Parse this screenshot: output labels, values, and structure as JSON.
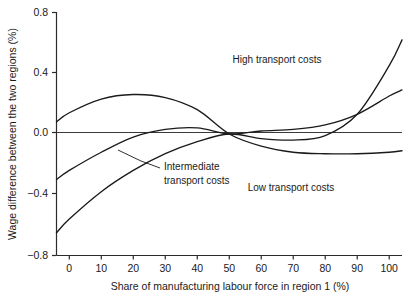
{
  "chart_data": {
    "type": "line",
    "title": "",
    "xlabel": "Share of manufacturing labour force in region 1 (%)",
    "ylabel": "Wage difference between the two regions (%)",
    "xlim": [
      -4,
      104
    ],
    "ylim": [
      -0.8,
      0.8
    ],
    "xticks": [
      0,
      10,
      20,
      30,
      40,
      50,
      60,
      70,
      80,
      90,
      100
    ],
    "xtick_labels": [
      "0",
      "10",
      "20",
      "30",
      "40",
      "50",
      "60",
      "70",
      "80",
      "90",
      "100"
    ],
    "yticks": [
      -0.8,
      -0.4,
      0.0,
      0.4,
      0.8
    ],
    "ytick_labels": [
      "−0.8",
      "−0.4",
      "0.0",
      "0.4",
      "0.8"
    ],
    "grid": false,
    "legend": "annotations-on-plot",
    "zero_reference_line": true,
    "series": [
      {
        "name": "Low transport costs",
        "label": "Low transport costs",
        "x": [
          -4,
          0,
          10,
          20,
          30,
          40,
          50,
          60,
          70,
          80,
          90,
          100,
          104
        ],
        "values": [
          0.08,
          0.14,
          0.23,
          0.26,
          0.24,
          0.16,
          0.0,
          -0.08,
          -0.12,
          -0.13,
          -0.13,
          -0.12,
          -0.11
        ]
      },
      {
        "name": "Intermediate transport costs",
        "label": "Intermediate transport costs",
        "x": [
          -4,
          0,
          10,
          20,
          30,
          40,
          50,
          60,
          70,
          80,
          90,
          100,
          104
        ],
        "values": [
          -0.3,
          -0.24,
          -0.12,
          -0.02,
          0.03,
          0.04,
          0.0,
          0.02,
          0.03,
          0.06,
          0.13,
          0.25,
          0.29
        ]
      },
      {
        "name": "High transport costs",
        "label": "High transport costs",
        "x": [
          -4,
          0,
          10,
          20,
          30,
          40,
          50,
          60,
          70,
          80,
          90,
          100,
          104
        ],
        "values": [
          -0.65,
          -0.56,
          -0.38,
          -0.24,
          -0.13,
          -0.05,
          0.0,
          -0.03,
          -0.04,
          -0.01,
          0.13,
          0.45,
          0.62
        ]
      }
    ],
    "annotations": [
      {
        "text": "High transport costs",
        "x_px": 277,
        "y_px": 60
      },
      {
        "text": "Intermediate",
        "x_px": 165,
        "y_px": 166
      },
      {
        "text": "transport costs",
        "x_px": 165,
        "y_px": 180
      },
      {
        "text": "Low transport costs",
        "x_px": 291,
        "y_px": 188
      }
    ]
  },
  "axes": {
    "y_title": "Wage difference between the two regions (%)",
    "x_title": "Share of manufacturing labour force in region 1 (%)",
    "y_labels": [
      "0.8",
      "0.4",
      "0.0",
      "−0.4",
      "−0.8"
    ],
    "x_labels": [
      "0",
      "10",
      "20",
      "30",
      "40",
      "50",
      "60",
      "70",
      "80",
      "90",
      "100"
    ]
  },
  "annotations": {
    "high": "High transport costs",
    "intermediate_line1": "Intermediate",
    "intermediate_line2": "transport costs",
    "low": "Low transport costs"
  },
  "colors": {
    "ink": "#1a1a1a",
    "background": "#ffffff"
  }
}
